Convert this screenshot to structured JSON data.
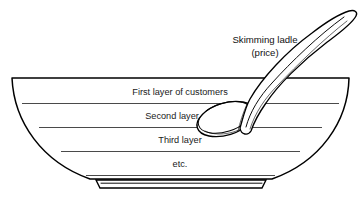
{
  "figure": {
    "domain": "diagram",
    "kind": "price-skimming-bowl-metaphor",
    "background_color": "#ffffff",
    "ink_color": "#000000",
    "layer_line_color": "#4a4a4a",
    "width": 361,
    "height": 208
  },
  "callout": {
    "line1": "Skimming ladle",
    "line2": "(price)",
    "icon_name": "skimming-ladle-icon"
  },
  "bowl": {
    "name": "market-bowl",
    "layers": [
      {
        "id": "layer-1",
        "label": "First layer of customers"
      },
      {
        "id": "layer-2",
        "label": "Second layer"
      },
      {
        "id": "layer-3",
        "label": "Third layer"
      },
      {
        "id": "layer-4",
        "label": "etc."
      }
    ]
  },
  "caption": {
    "text": ""
  }
}
